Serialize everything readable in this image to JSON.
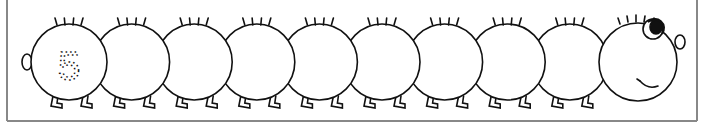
{
  "worksheet": {
    "number_label": "5",
    "segment_count": 10,
    "colors": {
      "line": "#111111",
      "frame": "#888888",
      "background": "#ffffff"
    }
  }
}
